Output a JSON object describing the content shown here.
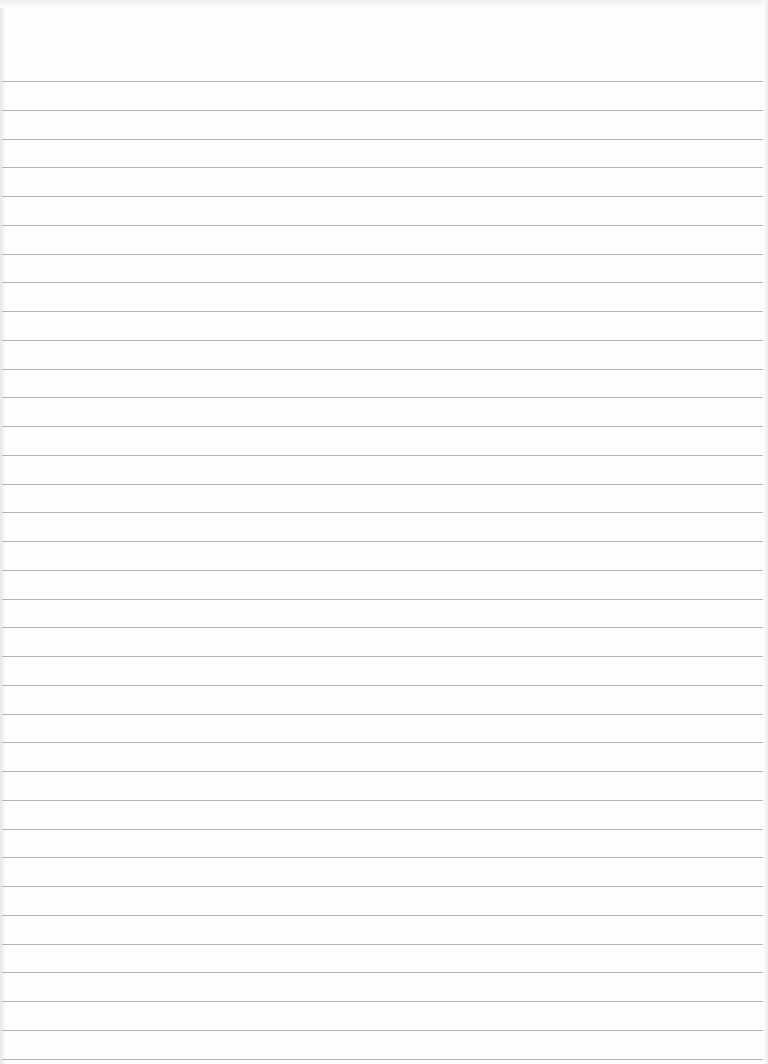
{
  "paper": {
    "type": "lined-paper",
    "background_color": "#fefefe",
    "rule_color": "#a9a9a9",
    "rule_count": 35,
    "first_rule_y": 81,
    "rule_spacing": 28.75
  }
}
